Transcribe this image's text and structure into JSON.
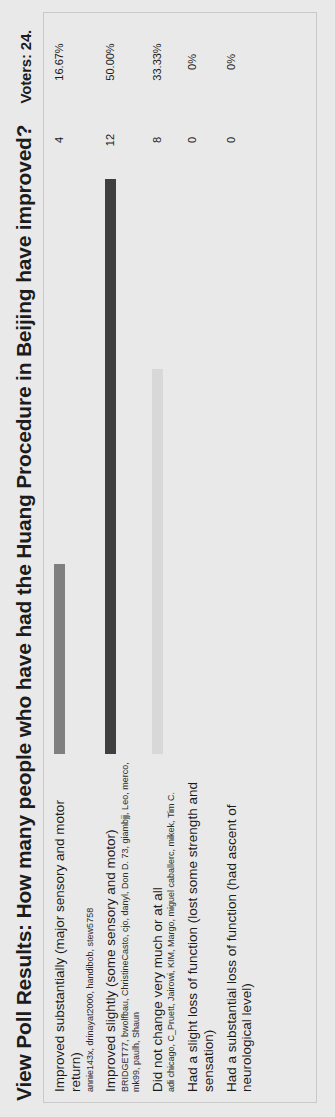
{
  "poll": {
    "title": "View Poll Results: How many people who have had the Huang Procedure in Beijing have improved?",
    "voters_label": "Voters: 24.",
    "total_voters": 24,
    "bar_colors": {
      "option1": "#7f7f7f",
      "option2": "#3f3f3f",
      "option3": "#d8d8d8"
    },
    "options": [
      {
        "label": "Improved substantially (major sensory and motor return)",
        "voters": "annie143x, drinayat2000, handibob, stew5758",
        "count": "4",
        "percent": "16.67%",
        "bar_width_pct": 33,
        "bar_color": "#7f7f7f"
      },
      {
        "label": "Improved slightly (some sensory and motor)",
        "voters": "BRIDGET77, bwolfbau, ChristineCasto, cjo, danyl, Don D. 73, giambjj, Leo, merco, mk99, paulh, Shaun",
        "count": "12",
        "percent": "50.00%",
        "bar_width_pct": 100,
        "bar_color": "#3f3f3f"
      },
      {
        "label": "Did not change very much or at all",
        "voters": "adi chicago, C_Pruett, Jairowi, KIM, Margo, miguel caballerc, mikek, Tim C.",
        "count": "8",
        "percent": "33.33%",
        "bar_width_pct": 67,
        "bar_color": "#d8d8d8"
      },
      {
        "label": "Had a slight loss of function (lost some strength and sensation)",
        "voters": "",
        "count": "0",
        "percent": "0%",
        "bar_width_pct": 0,
        "bar_color": "#d8d8d8"
      },
      {
        "label": "Had a substantial loss of function (had ascent of neurological level)",
        "voters": "",
        "count": "0",
        "percent": "0%",
        "bar_width_pct": 0,
        "bar_color": "#d8d8d8"
      }
    ]
  },
  "chart_data": {
    "type": "bar",
    "title": "View Poll Results: How many people who have had the Huang Procedure in Beijing have improved?",
    "categories": [
      "Improved substantially (major sensory and motor return)",
      "Improved slightly (some sensory and motor)",
      "Did not change very much or at all",
      "Had a slight loss of function (lost some strength and sensation)",
      "Had a substantial loss of function (had ascent of neurological level)"
    ],
    "values": [
      4,
      12,
      8,
      0,
      0
    ],
    "percentages": [
      "16.67%",
      "50.00%",
      "33.33%",
      "0%",
      "0%"
    ],
    "xlabel": "",
    "ylabel": "Votes",
    "ylim": [
      0,
      12
    ],
    "grid": false,
    "legend": "none",
    "total_voters": 24
  }
}
